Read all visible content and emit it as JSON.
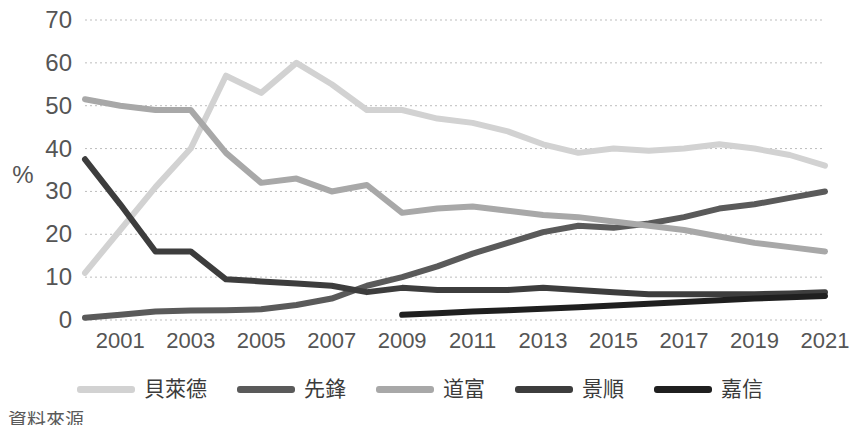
{
  "chart_data": {
    "type": "line",
    "title": "",
    "xlabel": "",
    "ylabel": "%",
    "ylim": [
      0,
      70
    ],
    "ytick_values": [
      70,
      60,
      50,
      40,
      30,
      20,
      10,
      0
    ],
    "ytick_labels": [
      "70",
      "60",
      "50",
      "40",
      "30",
      "20",
      "10",
      "0"
    ],
    "xlim": [
      2000,
      2021
    ],
    "x": [
      2000,
      2001,
      2002,
      2003,
      2004,
      2005,
      2006,
      2007,
      2008,
      2009,
      2010,
      2011,
      2012,
      2013,
      2014,
      2015,
      2016,
      2017,
      2018,
      2019,
      2020,
      2021
    ],
    "xtick_values": [
      2001,
      2003,
      2005,
      2007,
      2009,
      2011,
      2013,
      2015,
      2017,
      2019,
      2021
    ],
    "xtick_labels": [
      "2001",
      "2003",
      "2005",
      "2007",
      "2009",
      "2011",
      "2013",
      "2015",
      "2017",
      "2019",
      "2021"
    ],
    "grid": "horizontal-dotted",
    "legend_position": "bottom",
    "series": [
      {
        "name": "貝萊德",
        "color": "#d2d2d2",
        "values": [
          11,
          21,
          31,
          40,
          57,
          53,
          60,
          55,
          49,
          49,
          47,
          46,
          44,
          41,
          39,
          40,
          39.5,
          40,
          41,
          40,
          38.5,
          36
        ]
      },
      {
        "name": "先鋒",
        "color": "#5a5a5a",
        "values": [
          0.5,
          1.2,
          2,
          2.2,
          2.3,
          2.5,
          3.5,
          5,
          8,
          10,
          12.5,
          15.5,
          18,
          20.5,
          22,
          21.5,
          22.5,
          24,
          26,
          27,
          28.5,
          30
        ]
      },
      {
        "name": "道富",
        "color": "#a8a8a8",
        "values": [
          51.5,
          50,
          49,
          49,
          39,
          32,
          33,
          30,
          31.5,
          25,
          26,
          26.5,
          25.5,
          24.5,
          24,
          23,
          22,
          21,
          19.5,
          18,
          17,
          16
        ]
      },
      {
        "name": "景順",
        "color": "#3d3d3d",
        "values": [
          37.5,
          27,
          16,
          16,
          9.5,
          9,
          8.5,
          8,
          6.5,
          7.5,
          7,
          7,
          7,
          7.5,
          7,
          6.5,
          6,
          6,
          6,
          6,
          6.2,
          6.5
        ]
      },
      {
        "name": "嘉信",
        "color": "#1f1f1f",
        "values": [
          null,
          null,
          null,
          null,
          null,
          null,
          null,
          null,
          null,
          1.2,
          1.6,
          2,
          2.3,
          2.6,
          3,
          3.4,
          3.8,
          4.2,
          4.6,
          5,
          5.3,
          5.6
        ]
      }
    ]
  },
  "legend": {
    "items": [
      {
        "label": "貝萊德",
        "color": "#d2d2d2"
      },
      {
        "label": "先鋒",
        "color": "#5a5a5a"
      },
      {
        "label": "道富",
        "color": "#a8a8a8"
      },
      {
        "label": "景順",
        "color": "#3d3d3d"
      },
      {
        "label": "嘉信",
        "color": "#1f1f1f"
      }
    ]
  },
  "footnote": {
    "text": "資料來源"
  }
}
